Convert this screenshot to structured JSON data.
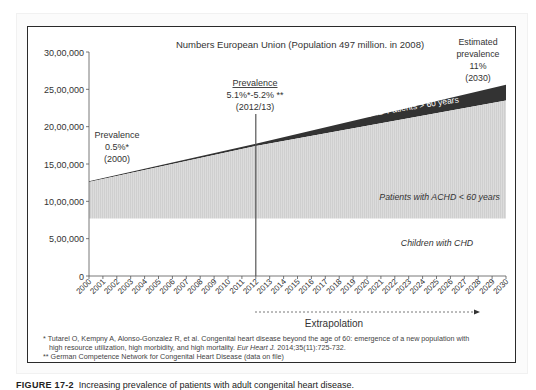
{
  "chart_data": {
    "type": "area",
    "title": "Numbers European Union (Population 497 million. in 2008)",
    "xlabel": "",
    "ylabel": "",
    "ylim": [
      0,
      3000000
    ],
    "xlim": [
      2000,
      2030
    ],
    "y_ticks": [
      "0",
      "5,00,000",
      "10,00,000",
      "15,00,000",
      "20,00,000",
      "25,00,000",
      "30,00,000"
    ],
    "x_ticks": [
      "2000",
      "2001",
      "2002",
      "2003",
      "2004",
      "2005",
      "2006",
      "2007",
      "2008",
      "2009",
      "2010",
      "2011",
      "2012",
      "2013",
      "2014",
      "2015",
      "2016",
      "2017",
      "2018",
      "2019",
      "2020",
      "2021",
      "2022",
      "2023",
      "2024",
      "2025",
      "2026",
      "2027",
      "2028",
      "2029",
      "2030"
    ],
    "x": [
      2000,
      2012,
      2030
    ],
    "series": [
      {
        "name": "Children with CHD",
        "values": [
          770000,
          770000,
          770000
        ],
        "color": "#ffffff"
      },
      {
        "name": "Patients with ACHD < 60 years",
        "values_top": [
          1260000,
          1740000,
          2350000
        ],
        "color": "#d8d8d8"
      },
      {
        "name": "ACHD Patients > 60 years",
        "values_top": [
          1270000,
          1770000,
          2560000
        ],
        "color": "#333333"
      }
    ],
    "annotations": [
      {
        "text": [
          "Prevalence",
          "0.5%*",
          "(2000)"
        ],
        "x": 2000
      },
      {
        "text": [
          "Prevalence",
          "5.1%*-5.2% **",
          "(2012/13)"
        ],
        "x": 2012
      },
      {
        "text": [
          "Estimated",
          "prevalence",
          "11%",
          "(2030)"
        ],
        "x": 2030
      }
    ],
    "vertical_line_x": 2012,
    "extrapolation": {
      "label": "Extrapolation",
      "from": 2012,
      "to": 2027
    }
  },
  "labels": {
    "title": "Numbers European Union (Population 497 million. in 2008)",
    "ann_2000": [
      "Prevalence",
      "0.5%*",
      "(2000)"
    ],
    "ann_2012": [
      "Prevalence",
      "5.1%*-5.2% **",
      "(2012/13)"
    ],
    "ann_2030": [
      "Estimated",
      "prevalence",
      "11%",
      "(2030)"
    ],
    "band_over60": "ACHD Patients > 60 years",
    "band_under60": "Patients with ACHD < 60 years",
    "band_children": "Children with CHD",
    "extrapolation": "Extrapolation"
  },
  "footnotes": {
    "line1": "* Tutarel O, Kempny A, Alonso-Gonzalez R, et al. Congenital heart disease beyond the age of 60: emergence of a new population with",
    "line2a": "high resource utilization, high morbidity, and high mortality. ",
    "line2b": "Eur Heart J.",
    "line2c": " 2014;35(11):725-732.",
    "line3": "** German Competence Network for Congenital Heart Disease (data on file)"
  },
  "caption": {
    "label": "FIGURE 17-2",
    "text": "Increasing prevalence of patients with adult congenital heart disease."
  }
}
